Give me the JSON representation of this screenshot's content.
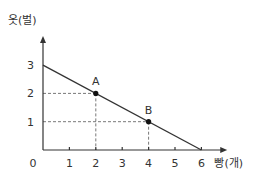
{
  "chart_data": {
    "type": "line",
    "title": "",
    "xlabel": "빵(개)",
    "ylabel": "옷(벌)",
    "origin_label": "0",
    "xlim": [
      0,
      6.6
    ],
    "ylim": [
      0,
      4.0
    ],
    "x_ticks": [
      1,
      2,
      3,
      4,
      5,
      6
    ],
    "x_tick_labels": [
      "1",
      "2",
      "3",
      "4",
      "5",
      "6"
    ],
    "y_ticks": [
      1,
      2,
      3
    ],
    "y_tick_labels": [
      "1",
      "2",
      "3"
    ],
    "grid": false,
    "series": [
      {
        "name": "production-possibility-line",
        "x": [
          0,
          6
        ],
        "y": [
          3,
          0
        ]
      }
    ],
    "points": [
      {
        "label": "A",
        "x": 2,
        "y": 2
      },
      {
        "label": "B",
        "x": 4,
        "y": 1
      }
    ],
    "guides": "dashed lines from points to both axes"
  }
}
